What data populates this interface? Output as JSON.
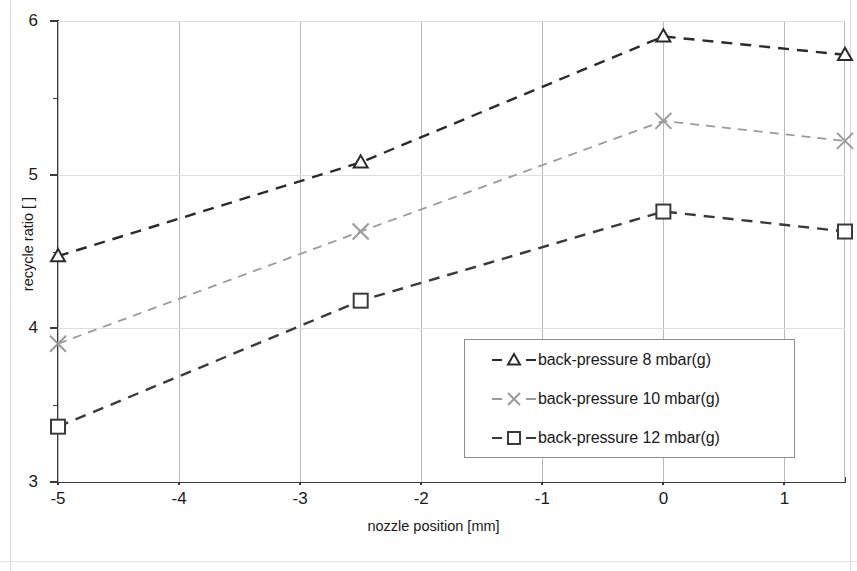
{
  "chart_data": {
    "type": "line",
    "title": "",
    "xlabel": "nozzle position [mm]",
    "ylabel": "recycle ratio [ ]",
    "xlim": [
      -5,
      1.5
    ],
    "ylim": [
      3,
      6
    ],
    "xticks": [
      -5,
      -4,
      -3,
      -2,
      -1,
      0,
      1
    ],
    "xticklabels": [
      "-5",
      "-4",
      "-3",
      "-2",
      "-1",
      "0",
      "1"
    ],
    "xminorticks": [
      -4.5,
      -3.5,
      -2.5,
      -1.5,
      -0.5,
      0.5,
      1.5
    ],
    "yticks": [
      3,
      4,
      5,
      6
    ],
    "yticklabels": [
      "3",
      "4",
      "5",
      "6"
    ],
    "yminorticks": [
      3.5,
      4.5,
      5.5
    ],
    "grid": {
      "vertical": true,
      "horizontal": true
    },
    "legend_position": "lower-right",
    "x": [
      -5,
      -2.5,
      0,
      1.5
    ],
    "series": [
      {
        "name": "back-pressure 8 mbar(g)",
        "marker": "triangle",
        "color": "#2b2b2b",
        "linestyle": "dashed",
        "values": [
          4.47,
          5.08,
          5.9,
          5.78
        ]
      },
      {
        "name": "back-pressure 10 mbar(g)",
        "marker": "x",
        "color": "#9a9a9a",
        "linestyle": "dashed",
        "values": [
          3.9,
          4.63,
          5.35,
          5.22
        ]
      },
      {
        "name": "back-pressure 12 mbar(g)",
        "marker": "square",
        "color": "#3a3a3a",
        "linestyle": "dashed",
        "values": [
          3.36,
          4.18,
          4.76,
          4.63
        ]
      }
    ]
  },
  "legend": {
    "items": [
      {
        "label": "back-pressure 8 mbar(g)",
        "marker": "triangle"
      },
      {
        "label": "back-pressure 10 mbar(g)",
        "marker": "x"
      },
      {
        "label": "back-pressure 12 mbar(g)",
        "marker": "square"
      }
    ]
  },
  "axes": {
    "y_title": "recycle ratio [ ]",
    "x_title": "nozzle position [mm]"
  }
}
